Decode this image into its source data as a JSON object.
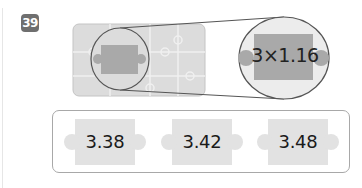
{
  "problem": {
    "number": "39"
  },
  "illustration": {
    "magnified_expression": "3×1.16",
    "colors": {
      "board": "#d9d9d9",
      "piece_dark": "#a9a9a9",
      "circle_fill": "#ececec",
      "outline": "#555555"
    }
  },
  "choices": [
    {
      "label": "3.38"
    },
    {
      "label": "3.42"
    },
    {
      "label": "3.48"
    }
  ]
}
